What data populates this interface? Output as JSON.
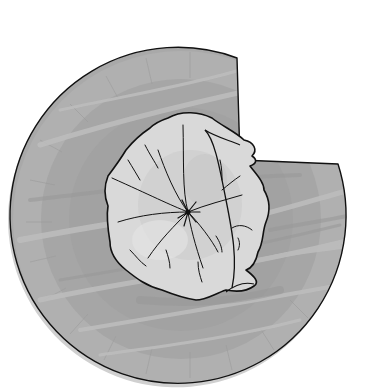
{
  "illustration": {
    "subject": "Paper plate with a wedge cut out and a crumpled napkin on top",
    "alt_text": "Grayscale drawing of a paper plate missing a slice, with a crumpled paper napkin in the center",
    "colors": {
      "background": "#ffffff",
      "plate_fill": "#a9a9a9",
      "plate_rim": "#b3b3b3",
      "plate_streak": "#bdbdbd",
      "plate_shadow": "#999999",
      "outline": "#111111",
      "napkin_fill": "#d9d9d9",
      "napkin_shade": "#c8c8c8",
      "napkin_highlight": "#e6e6e6"
    },
    "plate": {
      "cx": 181,
      "cy": 219,
      "r": 168
    },
    "wedge_cut": {
      "top_corner": [
        237,
        58
      ],
      "right_corner": [
        338,
        164
      ],
      "inner_point": [
        240,
        160
      ]
    }
  }
}
